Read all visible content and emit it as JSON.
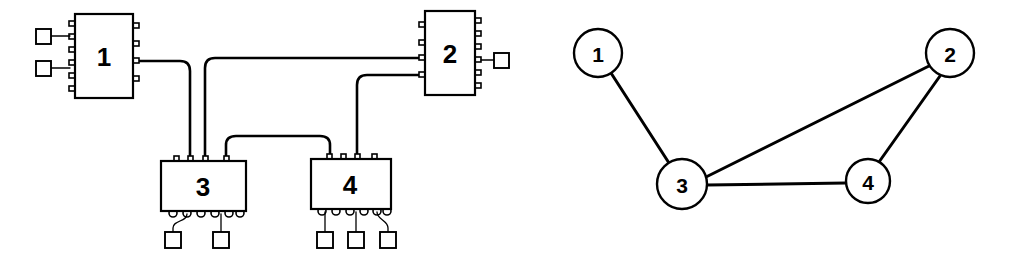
{
  "figure": {
    "stroke_color": "#000000",
    "fill_color": "#ffffff",
    "background": "#ffffff"
  },
  "block_diagram": {
    "name": "block-diagram-panel",
    "blocks": [
      {
        "id": "block-1",
        "label": "1",
        "x": 75,
        "y": 14,
        "w": 58,
        "h": 84,
        "pins_left": 6,
        "pins_right": 4,
        "pins_top": 0,
        "pins_bottom": 0
      },
      {
        "id": "block-2",
        "label": "2",
        "x": 425,
        "y": 11,
        "w": 50,
        "h": 84,
        "pins_left": 4,
        "pins_right": 6,
        "pins_top": 0,
        "pins_bottom": 0
      },
      {
        "id": "block-3",
        "label": "3",
        "x": 161,
        "y": 161,
        "w": 85,
        "h": 50,
        "pins_left": 0,
        "pins_right": 0,
        "pins_top": 4,
        "pins_bottom": 6
      },
      {
        "id": "block-4",
        "label": "4",
        "x": 311,
        "y": 159,
        "w": 80,
        "h": 50,
        "pins_left": 0,
        "pins_right": 0,
        "pins_top": 4,
        "pins_bottom": 6
      }
    ],
    "terminals": [
      {
        "id": "terminal-1a",
        "x": 36,
        "y": 36,
        "size": 15,
        "attached_to": "block-1"
      },
      {
        "id": "terminal-1b",
        "x": 36,
        "y": 68,
        "size": 15,
        "attached_to": "block-1"
      },
      {
        "id": "terminal-2a",
        "x": 494,
        "y": 53,
        "size": 15,
        "attached_to": "block-2"
      },
      {
        "id": "terminal-3a",
        "x": 165,
        "y": 232,
        "size": 16,
        "attached_to": "block-3"
      },
      {
        "id": "terminal-3b",
        "x": 213,
        "y": 232,
        "size": 16,
        "attached_to": "block-3"
      },
      {
        "id": "terminal-4a",
        "x": 317,
        "y": 232,
        "size": 16,
        "attached_to": "block-4"
      },
      {
        "id": "terminal-4b",
        "x": 348,
        "y": 232,
        "size": 16,
        "attached_to": "block-4"
      },
      {
        "id": "terminal-4c",
        "x": 380,
        "y": 232,
        "size": 16,
        "attached_to": "block-4"
      }
    ],
    "wires": [
      {
        "id": "wire-1-to-3",
        "from": "block-1",
        "to": "block-3",
        "path": "M133,61 L180,61 Q190,61 190,71 L190,161"
      },
      {
        "id": "wire-2-to-3",
        "from": "block-2",
        "to": "block-3",
        "path": "M425,58 L215,58 Q205,58 205,68 L205,161"
      },
      {
        "id": "wire-3-to-4",
        "from": "block-3",
        "to": "block-4",
        "path": "M226,161 L226,145 Q226,137 236,137 L320,137 Q330,137 330,145 L330,159"
      },
      {
        "id": "wire-2-to-4",
        "from": "block-2",
        "to": "block-4",
        "path": "M425,75 L367,75 Q357,75 357,85 L357,159"
      }
    ]
  },
  "graph": {
    "name": "connectivity-graph-panel",
    "nodes": [
      {
        "id": "node-1",
        "label": "1",
        "cx": 598,
        "cy": 53,
        "r": 24
      },
      {
        "id": "node-2",
        "label": "2",
        "cx": 950,
        "cy": 53,
        "r": 24
      },
      {
        "id": "node-3",
        "label": "3",
        "cx": 682,
        "cy": 184,
        "r": 25
      },
      {
        "id": "node-4",
        "label": "4",
        "cx": 868,
        "cy": 181,
        "r": 22
      }
    ],
    "edges": [
      {
        "id": "edge-1-3",
        "from": "node-1",
        "to": "node-3",
        "x1": 611,
        "y1": 73,
        "x2": 669,
        "y2": 163
      },
      {
        "id": "edge-3-2",
        "from": "node-3",
        "to": "node-2",
        "x1": 706,
        "y1": 177,
        "x2": 928,
        "y2": 66
      },
      {
        "id": "edge-3-4",
        "from": "node-3",
        "to": "node-4",
        "x1": 707,
        "y1": 185,
        "x2": 846,
        "y2": 183
      },
      {
        "id": "edge-4-2",
        "from": "node-4",
        "to": "node-2",
        "x1": 879,
        "y1": 162,
        "x2": 940,
        "y2": 76
      }
    ]
  }
}
